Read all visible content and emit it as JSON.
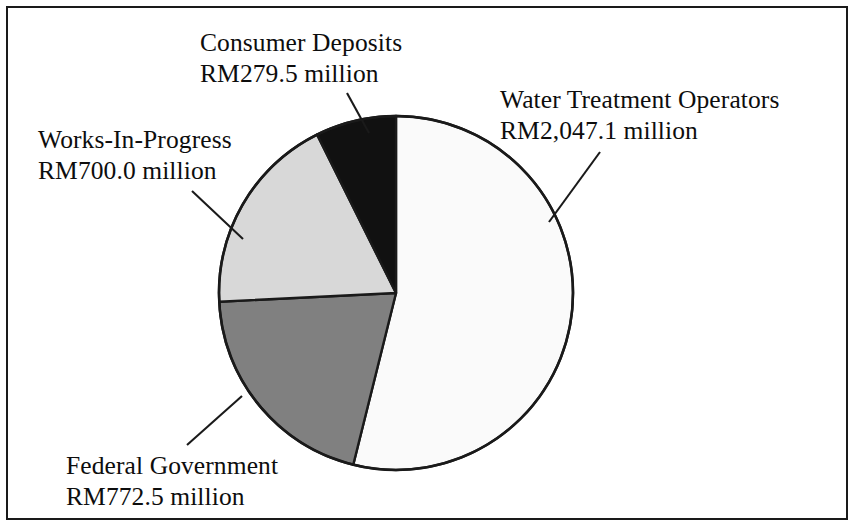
{
  "figure": {
    "border_color": "#1a1a1a",
    "background_color": "#ffffff"
  },
  "chart_data": {
    "type": "pie",
    "title": "",
    "subtitle": "",
    "xlabel": "",
    "ylabel": "",
    "units": "RM million",
    "total": 3799.1,
    "legend_position": "callout-labels",
    "grid": false,
    "start_angle_deg": 0,
    "direction": "clockwise",
    "categories": [
      "Water Treatment Operators",
      "Federal Government",
      "Works-In-Progress",
      "Consumer Deposits"
    ],
    "values": [
      2047.1,
      772.5,
      700.0,
      279.5
    ],
    "value_labels": [
      "RM2,047.1 million",
      "RM772.5 million",
      "RM700.0 million",
      "RM279.5 million"
    ],
    "percentages": [
      53.9,
      20.3,
      18.4,
      7.4
    ],
    "angles_deg": [
      193.98,
      73.2,
      66.33,
      26.49
    ],
    "colors": [
      "#fafafa",
      "#808080",
      "#d8d8d8",
      "#111111"
    ],
    "slice_border_color": "#1a1a1a",
    "slices": [
      {
        "name": "Water Treatment Operators",
        "value": 2047.1,
        "value_label": "RM2,047.1 million",
        "percent": 53.9,
        "color": "#fafafa",
        "start_angle_deg": 0,
        "end_angle_deg": 193.98
      },
      {
        "name": "Federal Government",
        "value": 772.5,
        "value_label": "RM772.5 million",
        "percent": 20.3,
        "color": "#808080",
        "start_angle_deg": 193.98,
        "end_angle_deg": 267.18
      },
      {
        "name": "Works-In-Progress",
        "value": 700.0,
        "value_label": "RM700.0 million",
        "percent": 18.4,
        "color": "#d8d8d8",
        "start_angle_deg": 267.18,
        "end_angle_deg": 333.51
      },
      {
        "name": "Consumer Deposits",
        "value": 279.5,
        "value_label": "RM279.5 million",
        "percent": 7.4,
        "color": "#111111",
        "start_angle_deg": 333.51,
        "end_angle_deg": 360
      }
    ]
  },
  "labels": {
    "consumer_deposits": {
      "name": "Consumer Deposits",
      "amount": "RM279.5 million"
    },
    "water_treatment": {
      "name": "Water Treatment Operators",
      "amount": "RM2,047.1 million"
    },
    "works_in_progress": {
      "name": "Works-In-Progress",
      "amount": "RM700.0 million"
    },
    "federal_government": {
      "name": "Federal Government",
      "amount": "RM772.5 million"
    }
  },
  "geometry": {
    "center_x": 396,
    "center_y": 293,
    "radius": 177
  }
}
